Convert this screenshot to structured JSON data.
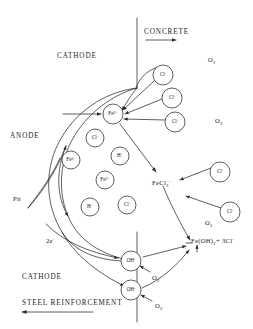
{
  "diagram": {
    "background_color": "#ffffff",
    "line_color": "#2a2a2a"
  },
  "labels": {
    "concrete": "CONCRETE",
    "cathode_top": "CATHODE",
    "cathode_bottom": "CATHODE",
    "anode": "ANODE",
    "pit": "Pit",
    "steel_reinforcement": "STEEL REINFORCEMENT",
    "electrons": "2e",
    "electrons_sup": "-",
    "fecl3_main": "FeCl",
    "fecl3_sub": "3",
    "fecl3_sup": "-",
    "product_main": "Fe(OH)",
    "product_sub": "2",
    "product_plus": "+ 3Cl",
    "product_sup": "-",
    "oxygen_main": "O",
    "oxygen_sub": "2"
  },
  "oxygen_markers": [
    {
      "id": "o2-top-right",
      "x": 208,
      "y": 57
    },
    {
      "id": "o2-mid-right",
      "x": 215,
      "y": 118
    },
    {
      "id": "o2-low-right",
      "x": 205,
      "y": 220
    },
    {
      "id": "o2-oh-upper",
      "x": 152,
      "y": 275
    },
    {
      "id": "o2-oh-lower",
      "x": 155,
      "y": 303
    }
  ],
  "species_bubbles": [
    {
      "id": "cl-top-1",
      "label": "Cl",
      "charge": "-",
      "x": 163,
      "y": 75,
      "r": 10
    },
    {
      "id": "cl-top-2",
      "label": "Cl",
      "charge": "-",
      "x": 172,
      "y": 98,
      "r": 10
    },
    {
      "id": "cl-top-3",
      "label": "Cl",
      "charge": "-",
      "x": 175,
      "y": 122,
      "r": 10
    },
    {
      "id": "cl-far-1",
      "label": "Cl",
      "charge": "-",
      "x": 220,
      "y": 172,
      "r": 10
    },
    {
      "id": "cl-far-2",
      "label": "Cl",
      "charge": "-",
      "x": 230,
      "y": 212,
      "r": 10
    },
    {
      "id": "fe-center",
      "label": "Fe",
      "charge": "2+",
      "x": 113,
      "y": 114,
      "r": 10
    },
    {
      "id": "cl-pit-1",
      "label": "Cl",
      "charge": "-",
      "x": 95,
      "y": 138,
      "r": 9
    },
    {
      "id": "fe-pit-1",
      "label": "Fe",
      "charge": "2+",
      "x": 71,
      "y": 160,
      "r": 9
    },
    {
      "id": "fe-pit-2",
      "label": "Fe",
      "charge": "2+",
      "x": 105,
      "y": 180,
      "r": 9
    },
    {
      "id": "h-pit-1",
      "label": "H",
      "charge": "+",
      "x": 120,
      "y": 156,
      "r": 9
    },
    {
      "id": "h-pit-2",
      "label": "H",
      "charge": "+",
      "x": 90,
      "y": 207,
      "r": 9
    },
    {
      "id": "cl-pit-2",
      "label": "Cl",
      "charge": "-",
      "x": 127,
      "y": 205,
      "r": 9
    },
    {
      "id": "oh-lower-1",
      "label": "OH",
      "charge": "-",
      "x": 131,
      "y": 261,
      "r": 10
    },
    {
      "id": "oh-lower-2",
      "label": "OH",
      "charge": "-",
      "x": 131,
      "y": 290,
      "r": 10
    }
  ]
}
